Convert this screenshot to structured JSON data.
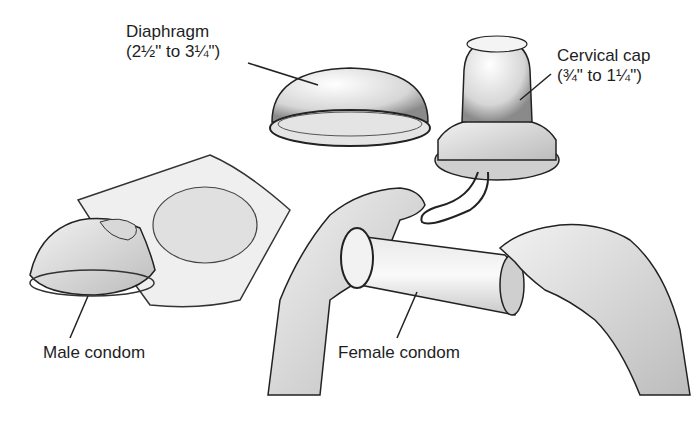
{
  "figure": {
    "labels": {
      "diaphragm": {
        "name": "Diaphragm",
        "size": "(2½\" to 3¼\")"
      },
      "cervical_cap": {
        "name": "Cervical cap",
        "size": "(¾\" to 1¼\")"
      },
      "male_condom": {
        "name": "Male condom"
      },
      "female_condom": {
        "name": "Female condom"
      }
    },
    "colors": {
      "ink": "#1e1e1e",
      "background": "#ffffff",
      "shade": "#bdbdbd"
    }
  }
}
